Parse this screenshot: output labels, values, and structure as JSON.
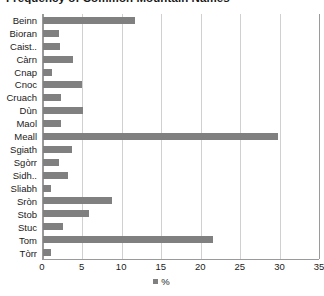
{
  "chart_data": {
    "type": "bar",
    "orientation": "horizontal",
    "title": "Frequency of Common Mountain Names",
    "xlabel": "",
    "ylabel": "",
    "xlim": [
      0,
      35
    ],
    "xticks": [
      0,
      5,
      10,
      15,
      20,
      25,
      30,
      35
    ],
    "grid": true,
    "legend_position": "bottom",
    "legend": [
      "%"
    ],
    "series_name": "%",
    "bar_color": "#808080",
    "grid_color": "#d0d0d0",
    "axis_color": "#9a9a9a",
    "categories": [
      "Beinn",
      "Bioran",
      "Caist..",
      "Càrn",
      "Cnap",
      "Cnoc",
      "Cruach",
      "Dùn",
      "Maol",
      "Meall",
      "Sgiath",
      "Sgòrr",
      "Sidh..",
      "Sliabh",
      "Sròn",
      "Stob",
      "Stuc",
      "Tom",
      "Tòrr"
    ],
    "values": [
      11.7,
      2.0,
      2.1,
      3.8,
      1.2,
      5.0,
      2.3,
      5.1,
      2.3,
      29.8,
      3.7,
      2.0,
      3.2,
      1.0,
      8.7,
      5.8,
      2.5,
      21.5,
      1.0
    ]
  }
}
